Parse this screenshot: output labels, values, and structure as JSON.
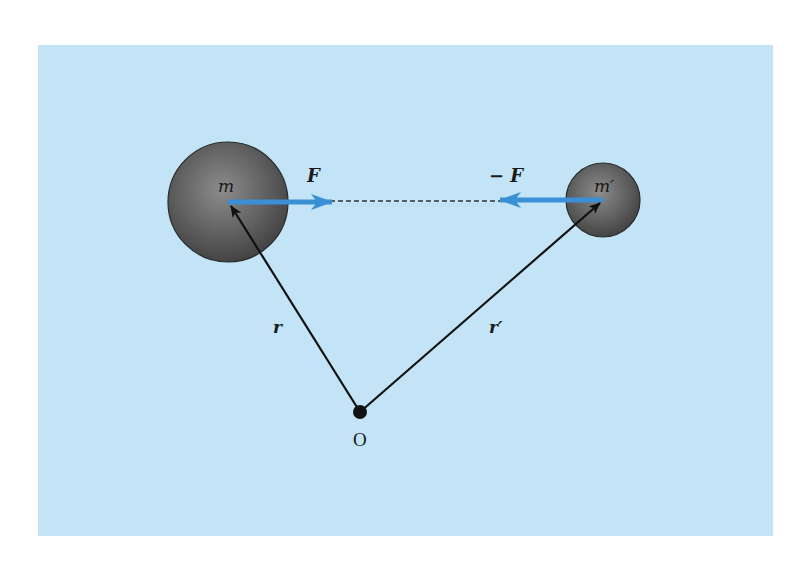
{
  "figure": {
    "colors": {
      "page_background": "#ffffff",
      "panel_background": "#c2e4f6",
      "sphere_fill_dark": "#4a4a4a",
      "sphere_fill_light": "#8a8a8a",
      "sphere_stroke": "#2a2a2a",
      "force_arrow": "#3b8fd4",
      "vector_line": "#111111",
      "dashed_line": "#333333",
      "label_text": "#1a1a1a"
    },
    "panel": {
      "x": 38,
      "y": 45,
      "width": 735,
      "height": 491
    },
    "mass_m": {
      "label": "m",
      "cx": 228,
      "cy": 202,
      "r": 60
    },
    "mass_m_prime": {
      "label": "m′",
      "cx": 603,
      "cy": 200,
      "r": 37
    },
    "force_on_m": {
      "label": "F",
      "x1": 228,
      "y1": 202,
      "x2": 332,
      "y2": 202
    },
    "force_on_m_prime": {
      "label": "− F",
      "x1": 603,
      "y1": 200,
      "x2": 500,
      "y2": 200
    },
    "interaction_line": {
      "style": "dashed",
      "x1": 332,
      "y1": 201,
      "x2": 500,
      "y2": 201
    },
    "origin": {
      "label": "O",
      "x": 360,
      "y": 412
    },
    "vector_r": {
      "label": "r"
    },
    "vector_r_prime": {
      "label": "r′"
    }
  }
}
